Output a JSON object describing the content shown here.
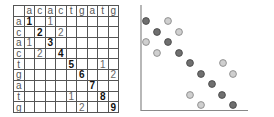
{
  "matrix": {
    "col_headers": [
      "",
      "a",
      "c",
      "a",
      "c",
      "t",
      "g",
      "a",
      "t",
      "g"
    ],
    "rows": [
      {
        "label": "a",
        "cells": [
          "1",
          "",
          "1",
          "",
          "",
          "",
          "",
          "",
          ""
        ],
        "bold": [
          0
        ]
      },
      {
        "label": "c",
        "cells": [
          "",
          "2",
          "",
          "2",
          "",
          "",
          "",
          "",
          ""
        ],
        "bold": [
          1
        ]
      },
      {
        "label": "a",
        "cells": [
          "1",
          "",
          "3",
          "",
          "",
          "",
          "",
          "",
          ""
        ],
        "bold": [
          2
        ]
      },
      {
        "label": "c",
        "cells": [
          "",
          "2",
          "",
          "4",
          "",
          "",
          "",
          "",
          ""
        ],
        "bold": [
          3
        ]
      },
      {
        "label": "t",
        "cells": [
          "",
          "",
          "",
          "",
          "5",
          "",
          "",
          "1",
          ""
        ],
        "bold": [
          4
        ]
      },
      {
        "label": "g",
        "cells": [
          "",
          "",
          "",
          "",
          "",
          "6",
          "",
          "",
          "2"
        ],
        "bold": [
          5
        ]
      },
      {
        "label": "a",
        "cells": [
          "",
          "",
          "",
          "",
          "",
          "",
          "7",
          "",
          ""
        ],
        "bold": [
          6
        ]
      },
      {
        "label": "t",
        "cells": [
          "",
          "",
          "",
          "",
          "1",
          "",
          "",
          "8",
          ""
        ],
        "bold": [
          7
        ]
      },
      {
        "label": "g",
        "cells": [
          "",
          "",
          "",
          "",
          "",
          "2",
          "",
          "",
          "9"
        ],
        "bold": [
          8
        ]
      }
    ]
  },
  "dotplot": {
    "colors": {
      "dark": "#6f6f6f",
      "dark_border": "#4a4a4a",
      "light": "#cfcfcf",
      "light_border": "#8a8a8a",
      "axis": "#888888"
    },
    "points": [
      {
        "x": 146,
        "y": 21,
        "kind": "dark"
      },
      {
        "x": 168,
        "y": 21,
        "kind": "light"
      },
      {
        "x": 157,
        "y": 32,
        "kind": "dark"
      },
      {
        "x": 179,
        "y": 32,
        "kind": "light"
      },
      {
        "x": 146,
        "y": 42,
        "kind": "light"
      },
      {
        "x": 168,
        "y": 42,
        "kind": "dark"
      },
      {
        "x": 157,
        "y": 53,
        "kind": "light"
      },
      {
        "x": 179,
        "y": 53,
        "kind": "dark"
      },
      {
        "x": 190,
        "y": 63,
        "kind": "dark"
      },
      {
        "x": 223,
        "y": 63,
        "kind": "light"
      },
      {
        "x": 201,
        "y": 74,
        "kind": "dark"
      },
      {
        "x": 233,
        "y": 74,
        "kind": "light"
      },
      {
        "x": 212,
        "y": 84,
        "kind": "dark"
      },
      {
        "x": 190,
        "y": 95,
        "kind": "light"
      },
      {
        "x": 222,
        "y": 95,
        "kind": "dark"
      },
      {
        "x": 201,
        "y": 105,
        "kind": "light"
      },
      {
        "x": 233,
        "y": 105,
        "kind": "dark"
      }
    ]
  }
}
